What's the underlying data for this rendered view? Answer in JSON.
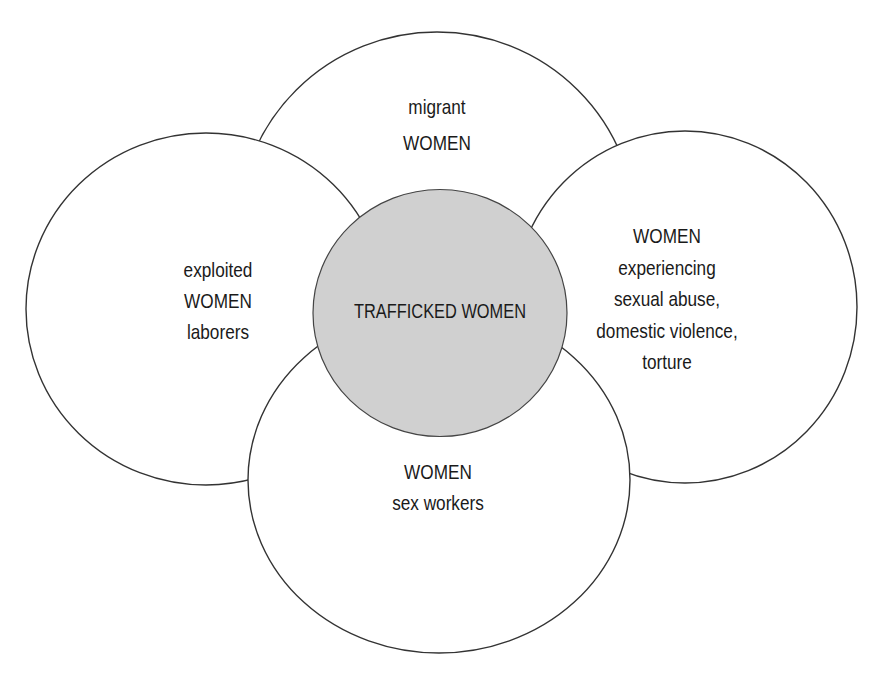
{
  "diagram": {
    "colors": {
      "background": "#ffffff",
      "outer_fill": "#ffffff",
      "stroke": "#333333",
      "center_fill": "#d0d0d0",
      "text": "#1a1a1a"
    },
    "center": {
      "label": "TRAFFICKED WOMEN"
    },
    "top": {
      "lines": [
        "migrant",
        "WOMEN"
      ]
    },
    "left": {
      "lines": [
        "exploited",
        "WOMEN",
        "laborers"
      ]
    },
    "right": {
      "lines": [
        "WOMEN",
        "experiencing",
        "sexual abuse,",
        "domestic violence,",
        "torture"
      ]
    },
    "bottom": {
      "lines": [
        "WOMEN",
        "sex workers"
      ]
    }
  }
}
